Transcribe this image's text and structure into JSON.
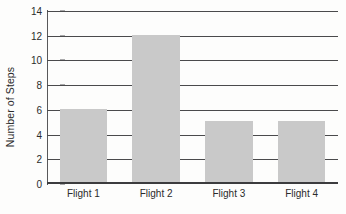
{
  "chart_data": {
    "type": "bar",
    "title": "",
    "subtitle": "",
    "xlabel": "",
    "ylabel": "Number of Steps",
    "categories": [
      "Flight 1",
      "Flight 2",
      "Flight 3",
      "Flight 4"
    ],
    "values": [
      6,
      12,
      5,
      5
    ],
    "ylim": [
      0,
      14
    ],
    "ytick_step": 2,
    "yticks": [
      0,
      2,
      4,
      6,
      8,
      10,
      12,
      14
    ],
    "ytick_labels": [
      "0",
      "2",
      "4",
      "6",
      "8",
      "10",
      "12",
      "14"
    ],
    "grid": {
      "horizontal": true,
      "vertical": false
    },
    "legend": {
      "visible": false,
      "position": "none",
      "entries": []
    },
    "annotations": [],
    "series": [
      {
        "name": "Number of Steps",
        "values": [
          6,
          12,
          5,
          5
        ]
      }
    ],
    "colors": {
      "bar_fill": "#c9c9c9",
      "gridline": "#4a4a4c",
      "axis_line": "#58585a",
      "text": "#2b2b2b",
      "background": "#fdfdfc"
    }
  }
}
